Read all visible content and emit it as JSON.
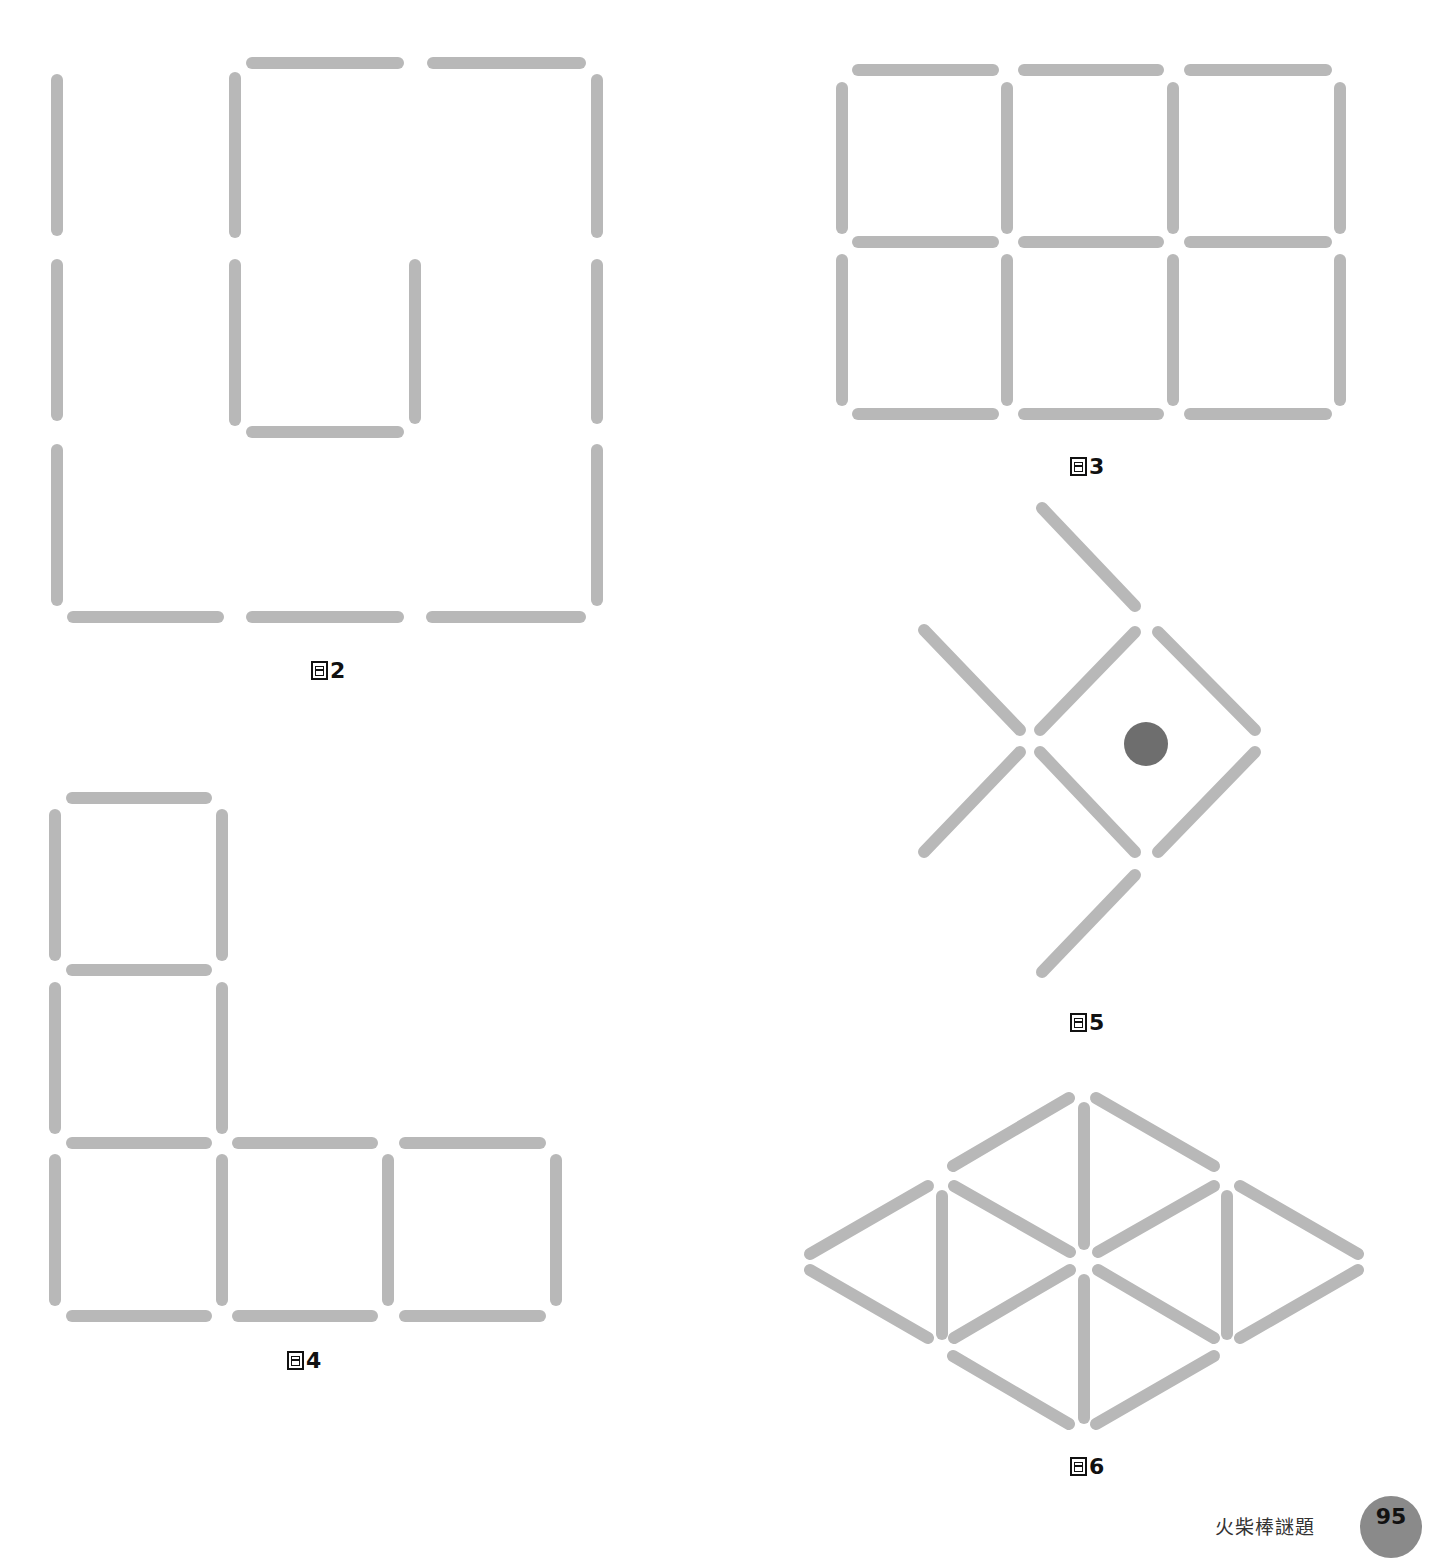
{
  "stick_color": "#b8b8b8",
  "dot_color": "#6e6e6e",
  "stick_width": 12,
  "figures": [
    {
      "label": "2",
      "label_pos": [
        311,
        658
      ],
      "sticks": [
        [
          57,
          80,
          57,
          230
        ],
        [
          235,
          78,
          235,
          232
        ],
        [
          597,
          80,
          597,
          232
        ],
        [
          252,
          63,
          398,
          63
        ],
        [
          433,
          63,
          580,
          63
        ],
        [
          57,
          265,
          57,
          415
        ],
        [
          235,
          265,
          235,
          420
        ],
        [
          415,
          265,
          415,
          418
        ],
        [
          597,
          265,
          597,
          418
        ],
        [
          252,
          432,
          398,
          432
        ],
        [
          57,
          450,
          57,
          600
        ],
        [
          597,
          450,
          597,
          600
        ],
        [
          73,
          617,
          218,
          617
        ],
        [
          252,
          617,
          398,
          617
        ],
        [
          432,
          617,
          580,
          617
        ]
      ]
    },
    {
      "label": "3",
      "label_pos": [
        1070,
        454
      ],
      "sticks": [
        [
          858,
          70,
          993,
          70
        ],
        [
          1024,
          70,
          1158,
          70
        ],
        [
          1190,
          70,
          1326,
          70
        ],
        [
          842,
          88,
          842,
          228
        ],
        [
          1007,
          88,
          1007,
          228
        ],
        [
          1173,
          88,
          1173,
          228
        ],
        [
          1340,
          88,
          1340,
          228
        ],
        [
          858,
          242,
          993,
          242
        ],
        [
          1024,
          242,
          1158,
          242
        ],
        [
          1190,
          242,
          1326,
          242
        ],
        [
          842,
          260,
          842,
          400
        ],
        [
          1007,
          260,
          1007,
          400
        ],
        [
          1173,
          260,
          1173,
          400
        ],
        [
          1340,
          260,
          1340,
          400
        ],
        [
          858,
          414,
          993,
          414
        ],
        [
          1024,
          414,
          1158,
          414
        ],
        [
          1190,
          414,
          1326,
          414
        ]
      ]
    },
    {
      "label": "5",
      "label_pos": [
        1070,
        1010
      ],
      "sticks": [
        [
          1042,
          508,
          1135,
          606
        ],
        [
          924,
          630,
          1020,
          730
        ],
        [
          1040,
          730,
          1135,
          632
        ],
        [
          1158,
          632,
          1255,
          730
        ],
        [
          924,
          852,
          1020,
          752
        ],
        [
          1040,
          752,
          1135,
          852
        ],
        [
          1158,
          852,
          1255,
          752
        ],
        [
          1042,
          972,
          1135,
          875
        ]
      ],
      "dot": {
        "cx": 1146,
        "cy": 744,
        "r": 22
      }
    },
    {
      "label": "4",
      "label_pos": [
        287,
        1348
      ],
      "sticks": [
        [
          72,
          798,
          206,
          798
        ],
        [
          55,
          815,
          55,
          955
        ],
        [
          222,
          815,
          222,
          955
        ],
        [
          72,
          970,
          206,
          970
        ],
        [
          55,
          988,
          55,
          1128
        ],
        [
          222,
          988,
          222,
          1128
        ],
        [
          72,
          1143,
          206,
          1143
        ],
        [
          238,
          1143,
          372,
          1143
        ],
        [
          405,
          1143,
          540,
          1143
        ],
        [
          55,
          1160,
          55,
          1300
        ],
        [
          222,
          1160,
          222,
          1300
        ],
        [
          388,
          1160,
          388,
          1300
        ],
        [
          556,
          1160,
          556,
          1300
        ],
        [
          72,
          1316,
          206,
          1316
        ],
        [
          238,
          1316,
          372,
          1316
        ],
        [
          405,
          1316,
          540,
          1316
        ]
      ]
    },
    {
      "label": "6",
      "label_pos": [
        1070,
        1454
      ],
      "sticks": [
        [
          953,
          1166,
          1069,
          1098
        ],
        [
          1096,
          1098,
          1214,
          1166
        ],
        [
          1084,
          1108,
          1084,
          1244
        ],
        [
          810,
          1254,
          928,
          1186
        ],
        [
          954,
          1186,
          1070,
          1252
        ],
        [
          1098,
          1252,
          1214,
          1186
        ],
        [
          1240,
          1186,
          1358,
          1254
        ],
        [
          942,
          1196,
          942,
          1334
        ],
        [
          1227,
          1196,
          1227,
          1334
        ],
        [
          810,
          1270,
          928,
          1338
        ],
        [
          954,
          1338,
          1070,
          1270
        ],
        [
          1098,
          1270,
          1214,
          1338
        ],
        [
          1240,
          1338,
          1358,
          1270
        ],
        [
          1084,
          1280,
          1084,
          1418
        ],
        [
          953,
          1356,
          1069,
          1424
        ],
        [
          1096,
          1424,
          1214,
          1356
        ]
      ]
    }
  ],
  "footer": {
    "title": "火柴棒謎題",
    "page_number": "95"
  }
}
